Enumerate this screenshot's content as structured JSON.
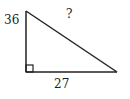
{
  "diagram": {
    "type": "right-triangle",
    "labels": {
      "vertical_leg": "36",
      "horizontal_leg": "27",
      "hypotenuse": "?"
    },
    "right_angle_marker": true,
    "stroke_color": "#222222"
  }
}
